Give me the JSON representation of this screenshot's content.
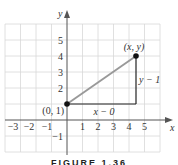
{
  "axes": {
    "x_label": "x",
    "y_label": "y",
    "x_ticks": [
      "−3",
      "−2",
      "−1",
      "1",
      "2",
      "3",
      "4",
      "5"
    ],
    "y_ticks": [
      "−1",
      "2",
      "3",
      "4",
      "5"
    ]
  },
  "points": {
    "p1_label": "(0, 1)",
    "p2_label": "(x, y)"
  },
  "legs": {
    "horizontal_label": "x − 0",
    "vertical_label": "y − 1"
  },
  "caption": "FIGURE 1.36",
  "colors": {
    "grid": "#d8d8d8",
    "axis": "#555555",
    "hypotenuse": "#999999",
    "legs": "#222222",
    "points": "#111111"
  }
}
